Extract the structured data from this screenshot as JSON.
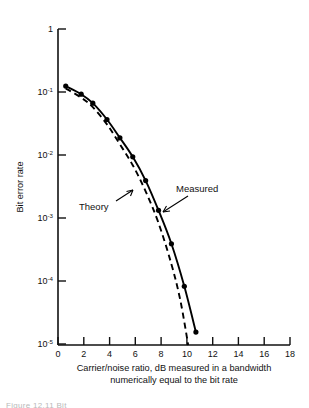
{
  "figure": {
    "background_color": "#ffffff",
    "ink_color": "#000000"
  },
  "caption": {
    "partial_text": "Figure  12.11 Bit"
  },
  "annotations": {
    "theory_label": "Theory",
    "measured_label": "Measured"
  },
  "axes": {
    "x_title_line1": "Carrier/noise ratio, dB measured in a bandwidth",
    "x_title_line2": "numerically equal to the bit rate",
    "y_title": "Bit error rate",
    "x_ticks": [
      "0",
      "2",
      "4",
      "6",
      "8",
      "10",
      "12",
      "14",
      "16",
      "18"
    ],
    "y_ticks": [
      {
        "mantissa": "1",
        "exponent": ""
      },
      {
        "mantissa": "10",
        "exponent": "-1"
      },
      {
        "mantissa": "10",
        "exponent": "-2"
      },
      {
        "mantissa": "10",
        "exponent": "-3"
      },
      {
        "mantissa": "10",
        "exponent": "-4"
      },
      {
        "mantissa": "10",
        "exponent": "-5"
      }
    ]
  },
  "chart_data": {
    "type": "line",
    "title": "",
    "xlabel": "Carrier/noise ratio, dB measured in a bandwidth numerically equal to the bit rate",
    "ylabel": "Bit error rate",
    "xlim": [
      0,
      18
    ],
    "ylim": [
      1e-05,
      1
    ],
    "yscale": "log",
    "xticks": [
      0,
      2,
      4,
      6,
      8,
      10,
      12,
      14,
      16,
      18
    ],
    "yticks": [
      1,
      0.1,
      0.01,
      0.001,
      0.0001,
      1e-05
    ],
    "grid": false,
    "legend": "annotated-inline",
    "series": [
      {
        "name": "Measured",
        "style": "solid-with-markers",
        "x": [
          0.6,
          1.8,
          2.7,
          3.8,
          4.8,
          5.8,
          6.8,
          7.8,
          8.8,
          9.8,
          10.7
        ],
        "y": [
          0.125,
          0.093,
          0.067,
          0.037,
          0.019,
          0.0095,
          0.004,
          0.00135,
          0.0004,
          8.5e-05,
          1.6e-05
        ],
        "markers": [
          {
            "x": 0.6,
            "y": 0.125
          },
          {
            "x": 1.8,
            "y": 0.093
          },
          {
            "x": 2.7,
            "y": 0.067
          },
          {
            "x": 3.8,
            "y": 0.037
          },
          {
            "x": 4.8,
            "y": 0.019
          },
          {
            "x": 5.8,
            "y": 0.0095
          },
          {
            "x": 6.8,
            "y": 0.004
          },
          {
            "x": 7.8,
            "y": 0.00135
          },
          {
            "x": 8.8,
            "y": 0.0004
          },
          {
            "x": 9.8,
            "y": 8.5e-05
          },
          {
            "x": 10.7,
            "y": 1.6e-05
          }
        ]
      },
      {
        "name": "Theory",
        "style": "dashed",
        "x": [
          0.6,
          1.8,
          2.7,
          3.8,
          4.8,
          5.8,
          6.8,
          7.8,
          8.8,
          9.5,
          10.1
        ],
        "y": [
          0.115,
          0.082,
          0.058,
          0.031,
          0.015,
          0.007,
          0.0027,
          0.00085,
          0.00019,
          5e-05,
          1e-05
        ]
      }
    ]
  }
}
